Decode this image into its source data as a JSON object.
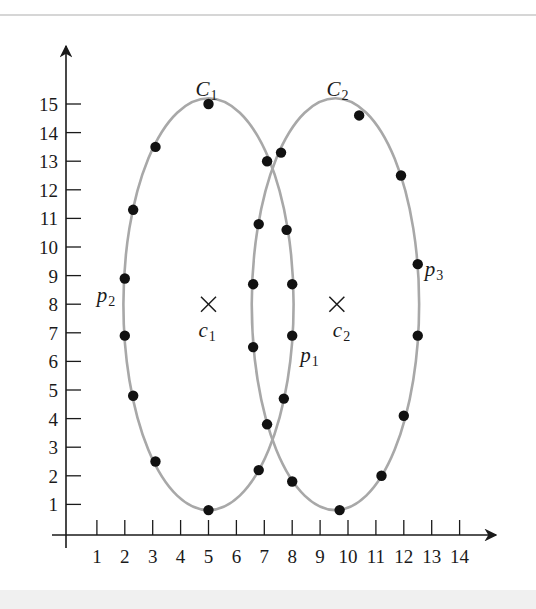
{
  "chart_data": {
    "type": "scatter",
    "title": "",
    "xlabel": "",
    "ylabel": "",
    "xlim": [
      0,
      14.5
    ],
    "ylim": [
      0,
      15.5
    ],
    "grid": false,
    "x_ticks": [
      "1",
      "2",
      "3",
      "4",
      "5",
      "6",
      "7",
      "8",
      "9",
      "10",
      "11",
      "12",
      "13",
      "14"
    ],
    "y_ticks": [
      "1",
      "2",
      "3",
      "4",
      "5",
      "6",
      "7",
      "8",
      "9",
      "10",
      "11",
      "12",
      "13",
      "14",
      "15"
    ],
    "clusters": [
      {
        "name": "C1",
        "label_main": "C",
        "label_sub": "1",
        "center_name_main": "c",
        "center_name_sub": "1",
        "center": [
          5,
          8
        ],
        "ellipse": {
          "cx": 5,
          "cy": 8,
          "rx": 3.05,
          "ry": 7.2
        },
        "points": [
          [
            5.0,
            15.0
          ],
          [
            3.1,
            13.5
          ],
          [
            2.3,
            11.3
          ],
          [
            2.0,
            8.9
          ],
          [
            2.0,
            6.9
          ],
          [
            2.3,
            4.8
          ],
          [
            3.1,
            2.5
          ],
          [
            5.0,
            0.8
          ],
          [
            6.8,
            2.2
          ],
          [
            7.1,
            3.8
          ],
          [
            8.0,
            6.9
          ],
          [
            8.0,
            8.7
          ],
          [
            7.8,
            10.6
          ],
          [
            7.1,
            13.0
          ]
        ]
      },
      {
        "name": "C2",
        "label_main": "C",
        "label_sub": "2",
        "center_name_main": "c",
        "center_name_sub": "2",
        "center": [
          9.6,
          8
        ],
        "ellipse": {
          "cx": 9.55,
          "cy": 8,
          "rx": 3.0,
          "ry": 7.2
        },
        "points": [
          [
            10.4,
            14.6
          ],
          [
            11.9,
            12.5
          ],
          [
            12.5,
            9.4
          ],
          [
            12.5,
            6.9
          ],
          [
            12.0,
            4.1
          ],
          [
            11.2,
            2.0
          ],
          [
            9.7,
            0.8
          ],
          [
            8.0,
            1.8
          ],
          [
            7.7,
            4.7
          ],
          [
            6.6,
            6.5
          ],
          [
            6.6,
            8.7
          ],
          [
            6.8,
            10.8
          ],
          [
            7.6,
            13.3
          ]
        ]
      }
    ],
    "annotations": [
      {
        "main": "p",
        "sub": "1",
        "point": [
          8.0,
          6.9
        ]
      },
      {
        "main": "p",
        "sub": "2",
        "point": [
          2.0,
          8.9
        ]
      },
      {
        "main": "p",
        "sub": "3",
        "point": [
          12.5,
          9.4
        ]
      }
    ],
    "colors": {
      "ellipse": "#a8a8a8",
      "point": "#111111",
      "axis": "#1a1a1a"
    }
  }
}
